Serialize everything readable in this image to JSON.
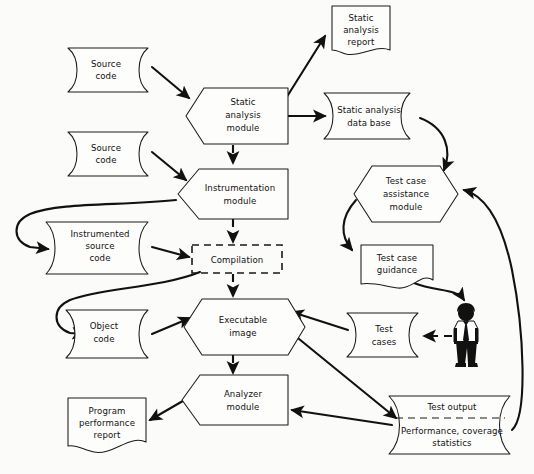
{
  "diagram": {
    "background_color": "#fbfbf9",
    "line_color": "#111111",
    "shape_fill": "#fdfdfb",
    "nodes": {
      "source_code_1": {
        "label_lines": [
          "Source",
          "code"
        ],
        "shape": "data",
        "x": 68,
        "y": 48,
        "w": 92,
        "h": 44
      },
      "source_code_2": {
        "label_lines": [
          "Source",
          "code"
        ],
        "shape": "data",
        "x": 68,
        "y": 132,
        "w": 92,
        "h": 44
      },
      "instrumented_source_code": {
        "label_lines": [
          "Instrumented",
          "source",
          "code"
        ],
        "shape": "data",
        "x": 42,
        "y": 222,
        "w": 110,
        "h": 52
      },
      "object_code": {
        "label_lines": [
          "Object",
          "code"
        ],
        "shape": "data",
        "x": 62,
        "y": 310,
        "w": 96,
        "h": 48
      },
      "static_analysis_module": {
        "label_lines": [
          "Static",
          "analysis",
          "module"
        ],
        "shape": "hexagon",
        "x": 178,
        "y": 88,
        "w": 110,
        "h": 56
      },
      "instrumentation_module": {
        "label_lines": [
          "Instrumentation",
          "module"
        ],
        "shape": "hexagon",
        "x": 176,
        "y": 168,
        "w": 114,
        "h": 50
      },
      "compilation": {
        "label_lines": [
          "Compilation"
        ],
        "shape": "dashed-box",
        "x": 192,
        "y": 245,
        "w": 90,
        "h": 28
      },
      "executable_image": {
        "label_lines": [
          "Executable",
          "image"
        ],
        "shape": "hexagon",
        "x": 180,
        "y": 300,
        "w": 108,
        "h": 54
      },
      "analyzer_module": {
        "label_lines": [
          "Analyzer",
          "module"
        ],
        "shape": "hexagon",
        "x": 180,
        "y": 376,
        "w": 108,
        "h": 50
      },
      "static_analysis_report": {
        "label_lines": [
          "Static",
          "analysis",
          "report"
        ],
        "shape": "document",
        "x": 330,
        "y": 4,
        "w": 62,
        "h": 54
      },
      "static_analysis_data_base": {
        "label_lines": [
          "Static analysis",
          "data base"
        ],
        "shape": "data",
        "x": 320,
        "y": 93,
        "w": 104,
        "h": 46
      },
      "test_case_assistance_module": {
        "label_lines": [
          "Test case",
          "assistance",
          "module"
        ],
        "shape": "hexagon",
        "x": 352,
        "y": 166,
        "w": 106,
        "h": 56
      },
      "test_case_guidance": {
        "label_lines": [
          "Test case",
          "guidance"
        ],
        "shape": "document",
        "x": 361,
        "y": 243,
        "w": 72,
        "h": 47
      },
      "test_cases": {
        "label_lines": [
          "Test",
          "cases"
        ],
        "shape": "data",
        "x": 345,
        "y": 313,
        "w": 72,
        "h": 44
      },
      "test_output": {
        "label_lines": [
          "Test output",
          "Performance, coverage",
          "statistics"
        ],
        "shape": "data-split",
        "x": 385,
        "y": 396,
        "w": 132,
        "h": 60
      },
      "program_performance_report": {
        "label_lines": [
          "Program",
          "performance",
          "report"
        ],
        "shape": "document",
        "x": 66,
        "y": 396,
        "w": 78,
        "h": 56
      },
      "tester": {
        "label_lines": [],
        "shape": "person",
        "x": 462,
        "y": 305,
        "w": 34,
        "h": 62
      }
    },
    "edges": [
      {
        "from": "source_code_1",
        "to": "static_analysis_module",
        "style": "solid",
        "arrow": true
      },
      {
        "from": "static_analysis_module",
        "to": "static_analysis_report",
        "style": "solid",
        "arrow": true
      },
      {
        "from": "static_analysis_module",
        "to": "static_analysis_data_base",
        "style": "solid",
        "arrow": true
      },
      {
        "from": "static_analysis_module",
        "to": "instrumentation_module",
        "style": "dashed",
        "arrow": true
      },
      {
        "from": "source_code_2",
        "to": "instrumentation_module",
        "style": "solid",
        "arrow": true
      },
      {
        "from": "instrumentation_module",
        "to": "instrumented_source_code",
        "style": "solid-curve",
        "arrow": true
      },
      {
        "from": "instrumentation_module",
        "to": "compilation",
        "style": "dashed",
        "arrow": true
      },
      {
        "from": "instrumented_source_code",
        "to": "compilation",
        "style": "solid",
        "arrow": true
      },
      {
        "from": "compilation",
        "to": "object_code",
        "style": "solid-curve",
        "arrow": true
      },
      {
        "from": "compilation",
        "to": "executable_image",
        "style": "dashed",
        "arrow": true
      },
      {
        "from": "object_code",
        "to": "executable_image",
        "style": "solid",
        "arrow": true
      },
      {
        "from": "executable_image",
        "to": "analyzer_module",
        "style": "dashed",
        "arrow": true
      },
      {
        "from": "static_analysis_data_base",
        "to": "test_case_assistance_module",
        "style": "solid-curve",
        "arrow": true
      },
      {
        "from": "test_case_assistance_module",
        "to": "test_case_guidance",
        "style": "solid-curve",
        "arrow": true
      },
      {
        "from": "test_case_guidance",
        "to": "tester",
        "style": "solid-curve",
        "arrow": true
      },
      {
        "from": "tester",
        "to": "test_cases",
        "style": "dashed",
        "arrow": true
      },
      {
        "from": "test_cases",
        "to": "executable_image",
        "style": "solid",
        "arrow": true
      },
      {
        "from": "executable_image",
        "to": "test_output",
        "style": "solid",
        "arrow": true
      },
      {
        "from": "test_output",
        "to": "analyzer_module",
        "style": "solid",
        "arrow": true
      },
      {
        "from": "test_output",
        "to": "test_case_assistance_module",
        "style": "solid-curve",
        "arrow": true
      },
      {
        "from": "analyzer_module",
        "to": "program_performance_report",
        "style": "solid",
        "arrow": true
      }
    ]
  }
}
